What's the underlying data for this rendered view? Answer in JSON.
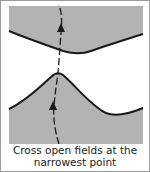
{
  "diagram": {
    "type": "illustration",
    "colors": {
      "field_fill": "#b3b3b3",
      "edge_stroke": "#1a1a1a",
      "path_stroke": "#1a1a1a",
      "background": "#ffffff",
      "border": "#9a9a9a"
    },
    "elements": [
      {
        "name": "top-field",
        "shape": "region",
        "edge": "curved, dipping downward toward the middle"
      },
      {
        "name": "bottom-field",
        "shape": "region",
        "edge": "curved, peaking upward toward the top field"
      },
      {
        "name": "crossing-path",
        "shape": "dashed line with arrows",
        "direction": "upward",
        "arrows": 2
      }
    ]
  },
  "caption": {
    "line1": "Cross open fields at the",
    "line2": "narrowest point"
  }
}
